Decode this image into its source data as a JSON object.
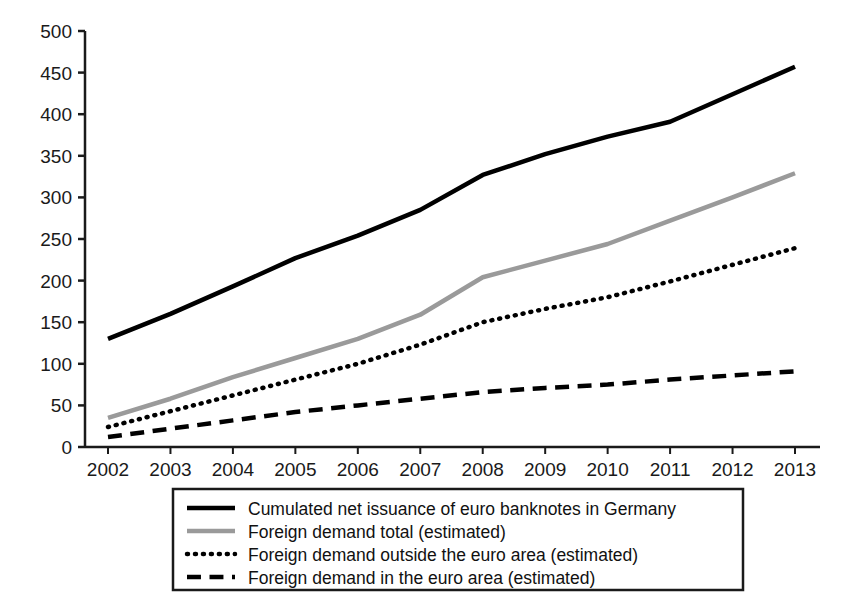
{
  "chart_data": {
    "type": "line",
    "title": "",
    "subtitle": "",
    "xlabel": "",
    "ylabel": "",
    "categories": [
      "2002",
      "2003",
      "2004",
      "2005",
      "2006",
      "2007",
      "2008",
      "2009",
      "2010",
      "2011",
      "2012",
      "2013"
    ],
    "xlim": [
      "2002",
      "2013"
    ],
    "ylim": [
      0,
      500
    ],
    "yticks": [
      0,
      50,
      100,
      150,
      200,
      250,
      300,
      350,
      400,
      450,
      500
    ],
    "ytick_labels": [
      "0",
      "50",
      "100",
      "150",
      "200",
      "250",
      "300",
      "350",
      "400",
      "450",
      "500"
    ],
    "grid": false,
    "legend_position": "bottom",
    "series": [
      {
        "name": "Cumulated net issuance of euro banknotes in Germany",
        "style": "solid",
        "color": "#000000",
        "width": 4.5,
        "values": [
          130,
          160,
          193,
          227,
          254,
          285,
          327,
          352,
          373,
          391,
          424,
          457
        ]
      },
      {
        "name": "Foreign demand total (estimated)",
        "style": "solid",
        "color": "#9a9a9a",
        "width": 4.5,
        "values": [
          35,
          58,
          84,
          107,
          130,
          159,
          204,
          224,
          244,
          272,
          300,
          329
        ]
      },
      {
        "name": "Foreign demand outside the euro area (estimated)",
        "style": "dotted",
        "color": "#000000",
        "width": 4.5,
        "values": [
          24,
          43,
          62,
          81,
          100,
          123,
          150,
          166,
          180,
          199,
          219,
          239
        ]
      },
      {
        "name": "Foreign demand in the euro area (estimated)",
        "style": "dashed",
        "color": "#000000",
        "width": 4.5,
        "values": [
          12,
          22,
          32,
          42,
          50,
          58,
          66,
          71,
          75,
          81,
          86,
          91
        ]
      }
    ]
  },
  "legend": {
    "items": [
      {
        "label": "Cumulated net issuance of euro banknotes in Germany",
        "style": "solid",
        "color": "#000000"
      },
      {
        "label": "Foreign demand total (estimated)",
        "style": "solid",
        "color": "#9a9a9a"
      },
      {
        "label": "Foreign demand outside the euro area (estimated)",
        "style": "dotted",
        "color": "#000000"
      },
      {
        "label": "Foreign demand in the euro area (estimated)",
        "style": "dashed",
        "color": "#000000"
      }
    ]
  }
}
